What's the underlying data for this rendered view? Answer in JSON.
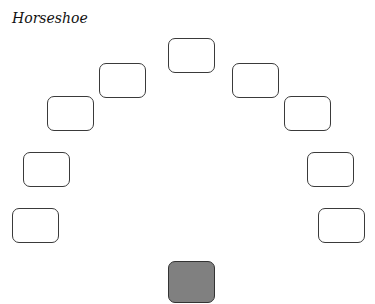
{
  "title": "Horseshoe",
  "layout": {
    "type": "horseshoe",
    "student_desks": 10,
    "teacher_desk": 1
  },
  "colors": {
    "desk_fill": "#ffffff",
    "desk_border": "#3a3a3a",
    "teacher_desk_fill": "#808080"
  }
}
